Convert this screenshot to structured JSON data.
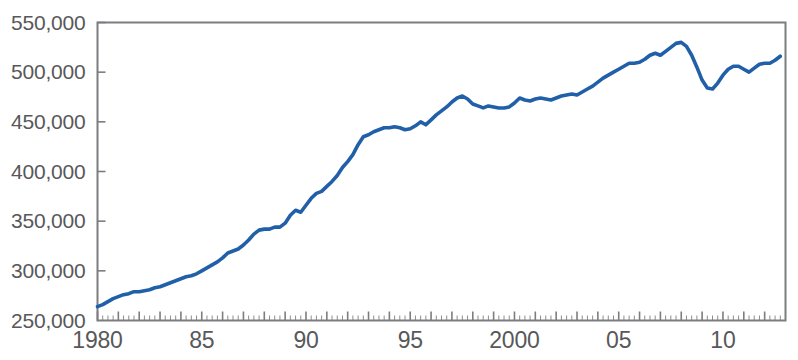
{
  "chart_data": {
    "type": "line",
    "title": "",
    "xlabel": "",
    "ylabel": "",
    "xlim": [
      1980,
      2012.75
    ],
    "ylim": [
      250000,
      550000
    ],
    "grid": false,
    "legend": null,
    "y_ticks": [
      250000,
      300000,
      350000,
      400000,
      450000,
      500000,
      550000
    ],
    "y_tick_labels": [
      "250,000",
      "300,000",
      "350,000",
      "400,000",
      "450,000",
      "500,000",
      "550,000"
    ],
    "x_ticks": [
      1980,
      1985,
      1990,
      1995,
      2000,
      2005,
      2010
    ],
    "x_tick_labels": [
      "1980",
      "85",
      "90",
      "95",
      "2000",
      "05",
      "10"
    ],
    "x_minor_tick_interval": 0.25,
    "series": [
      {
        "name": "series-1",
        "color": "#2160a8",
        "x": [
          1980.0,
          1980.25,
          1980.5,
          1980.75,
          1981.0,
          1981.25,
          1981.5,
          1981.75,
          1982.0,
          1982.25,
          1982.5,
          1982.75,
          1983.0,
          1983.25,
          1983.5,
          1983.75,
          1984.0,
          1984.25,
          1984.5,
          1984.75,
          1985.0,
          1985.25,
          1985.5,
          1985.75,
          1986.0,
          1986.25,
          1986.5,
          1986.75,
          1987.0,
          1987.25,
          1987.5,
          1987.75,
          1988.0,
          1988.25,
          1988.5,
          1988.75,
          1989.0,
          1989.25,
          1989.5,
          1989.75,
          1990.0,
          1990.25,
          1990.5,
          1990.75,
          1991.0,
          1991.25,
          1991.5,
          1991.75,
          1992.0,
          1992.25,
          1992.5,
          1992.75,
          1993.0,
          1993.25,
          1993.5,
          1993.75,
          1994.0,
          1994.25,
          1994.5,
          1994.75,
          1995.0,
          1995.25,
          1995.5,
          1995.75,
          1996.0,
          1996.25,
          1996.5,
          1996.75,
          1997.0,
          1997.25,
          1997.5,
          1997.75,
          1998.0,
          1998.25,
          1998.5,
          1998.75,
          1999.0,
          1999.25,
          1999.5,
          1999.75,
          2000.0,
          2000.25,
          2000.5,
          2000.75,
          2001.0,
          2001.25,
          2001.5,
          2001.75,
          2002.0,
          2002.25,
          2002.5,
          2002.75,
          2003.0,
          2003.25,
          2003.5,
          2003.75,
          2004.0,
          2004.25,
          2004.5,
          2004.75,
          2005.0,
          2005.25,
          2005.5,
          2005.75,
          2006.0,
          2006.25,
          2006.5,
          2006.75,
          2007.0,
          2007.25,
          2007.5,
          2007.75,
          2008.0,
          2008.25,
          2008.5,
          2008.75,
          2009.0,
          2009.25,
          2009.5,
          2009.75,
          2010.0,
          2010.25,
          2010.5,
          2010.75,
          2011.0,
          2011.25,
          2011.5,
          2011.75,
          2012.0,
          2012.25,
          2012.5,
          2012.75
        ],
        "y": [
          264000,
          266000,
          269000,
          272000,
          274000,
          276000,
          277000,
          279000,
          279000,
          280000,
          281000,
          283000,
          284000,
          286000,
          288000,
          290000,
          292000,
          294000,
          295000,
          297000,
          300000,
          303000,
          306000,
          309000,
          313000,
          318000,
          320000,
          322000,
          326000,
          331000,
          337000,
          341000,
          342000,
          342000,
          344000,
          344000,
          348000,
          356000,
          361000,
          359000,
          366000,
          373000,
          378000,
          380000,
          385000,
          390000,
          396000,
          404000,
          410000,
          417000,
          427000,
          435000,
          437000,
          440000,
          442000,
          444000,
          444000,
          445000,
          444000,
          442000,
          443000,
          446000,
          450000,
          447000,
          452000,
          457000,
          461000,
          465000,
          470000,
          474000,
          476000,
          473000,
          468000,
          466000,
          464000,
          466000,
          465000,
          464000,
          464000,
          465000,
          469000,
          474000,
          472000,
          471000,
          473000,
          474000,
          473000,
          472000,
          474000,
          476000,
          477000,
          478000,
          477000,
          480000,
          483000,
          486000,
          490000,
          494000,
          497000,
          500000,
          503000,
          506000,
          509000,
          509000,
          510000,
          513000,
          517000,
          519000,
          517000,
          521000,
          525000,
          529000,
          530000,
          526000,
          517000,
          505000,
          492000,
          484000,
          483000,
          489000,
          497000,
          503000,
          506000,
          506000,
          503000,
          500000,
          504000,
          508000,
          509000,
          509000,
          512000,
          516000
        ]
      }
    ]
  },
  "axis": {
    "y_label_format": "comma-separated",
    "frame_color": "#7d7d80",
    "text_color": "#58585a"
  }
}
